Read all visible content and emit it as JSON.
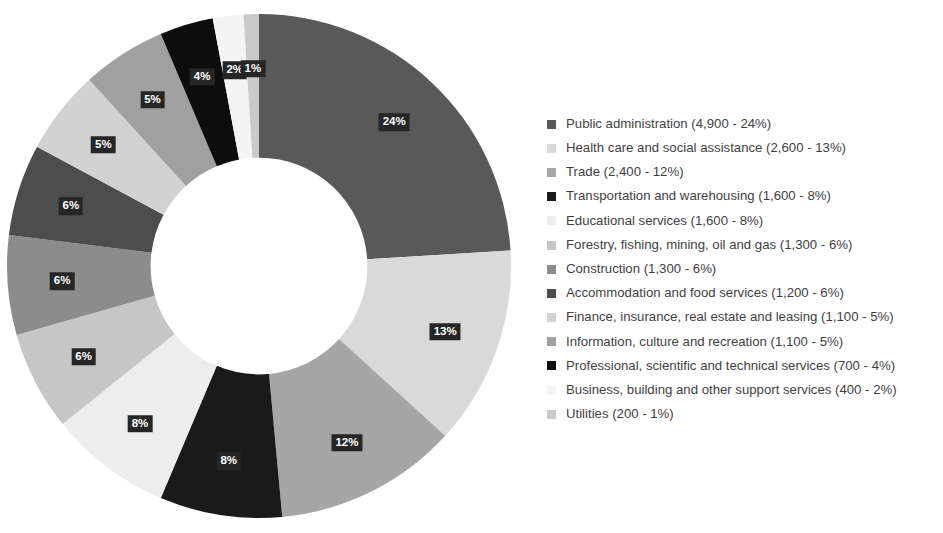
{
  "chart_data": {
    "type": "pie",
    "variant": "donut",
    "title": "",
    "subtitle": "",
    "xlabel": "",
    "ylabel": "",
    "grid": false,
    "legend_position": "right",
    "start_angle_deg": 0,
    "direction": "clockwise",
    "inner_radius_ratio": 0.43,
    "value_unit": "jobs",
    "total": 20400,
    "categories": [
      "Public administration",
      "Health care and social assistance",
      "Trade",
      "Transportation and warehousing",
      "Educational services",
      "Forestry, fishing, mining, oil and gas",
      "Construction",
      "Accommodation and food services",
      "Finance, insurance, real estate and leasing",
      "Information, culture and recreation",
      "Professional, scientific and technical services",
      "Business, building and other support services",
      "Utilities"
    ],
    "values": [
      4900,
      2600,
      2400,
      1600,
      1600,
      1300,
      1300,
      1200,
      1100,
      1100,
      700,
      400,
      200
    ],
    "percents": [
      24,
      13,
      12,
      8,
      8,
      6,
      6,
      6,
      5,
      5,
      4,
      2,
      1
    ],
    "slice_labels": [
      "24%",
      "13%",
      "12%",
      "8%",
      "8%",
      "6%",
      "6%",
      "6%",
      "5%",
      "5%",
      "4%",
      "2%",
      "1%"
    ],
    "colors": [
      "#595959",
      "#D9D9D9",
      "#A6A6A6",
      "#1A1A1A",
      "#EDEDED",
      "#C6C6C6",
      "#8C8C8C",
      "#4D4D4D",
      "#D2D2D2",
      "#A0A0A0",
      "#0D0D0D",
      "#F4F4F4",
      "#CACACA"
    ],
    "label_text_color": "#FFFFFF",
    "label_box_color": "#262626"
  },
  "legend": {
    "items": [
      {
        "label": "Public administration (4,900 - 24%)",
        "color": "#595959"
      },
      {
        "label": "Health care and social assistance (2,600 - 13%)",
        "color": "#D9D9D9"
      },
      {
        "label": "Trade (2,400 - 12%)",
        "color": "#A6A6A6"
      },
      {
        "label": "Transportation and warehousing (1,600 - 8%)",
        "color": "#1A1A1A"
      },
      {
        "label": "Educational services (1,600 - 8%)",
        "color": "#EDEDED"
      },
      {
        "label": "Forestry, fishing, mining, oil and gas (1,300 - 6%)",
        "color": "#C6C6C6"
      },
      {
        "label": "Construction (1,300 - 6%)",
        "color": "#8C8C8C"
      },
      {
        "label": "Accommodation and food services (1,200 - 6%)",
        "color": "#4D4D4D"
      },
      {
        "label": "Finance, insurance, real estate and leasing (1,100 - 5%)",
        "color": "#D2D2D2"
      },
      {
        "label": "Information, culture and recreation (1,100 - 5%)",
        "color": "#A0A0A0"
      },
      {
        "label": "Professional, scientific and technical services (700 - 4%)",
        "color": "#0D0D0D"
      },
      {
        "label": "Business, building and other support services (400 - 2%)",
        "color": "#F4F4F4"
      },
      {
        "label": "Utilities (200 - 1%)",
        "color": "#CACACA"
      }
    ]
  }
}
